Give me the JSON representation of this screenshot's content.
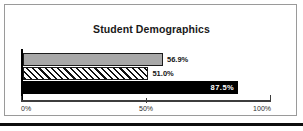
{
  "chart_data": {
    "type": "bar",
    "orientation": "horizontal",
    "title": "Student Demographics",
    "xlabel": "",
    "ylabel": "",
    "categories": [
      "series-1",
      "series-2",
      "series-3"
    ],
    "values": [
      56.9,
      51.0,
      87.5
    ],
    "value_labels": [
      "56.9%",
      "51.0%",
      "87.5%"
    ],
    "xlim": [
      0,
      100
    ],
    "xticks": [
      0,
      50,
      100
    ],
    "xtick_labels": [
      "0%",
      "50%",
      "100%"
    ],
    "grid": false,
    "legend": "none",
    "series_styles": [
      "solid-gray",
      "diagonal-hatch",
      "solid-black"
    ],
    "colors": {
      "bar_gray": "#a8a8a8",
      "bar_hatch_line": "#111111",
      "bar_hatch_bg": "#ffffff",
      "bar_black": "#000000",
      "axis": "#3d3d3d",
      "frame": "#9a9a9a",
      "rule": "#0d0d0d",
      "label_dark": "#141414",
      "label_light": "#ffffff"
    }
  }
}
